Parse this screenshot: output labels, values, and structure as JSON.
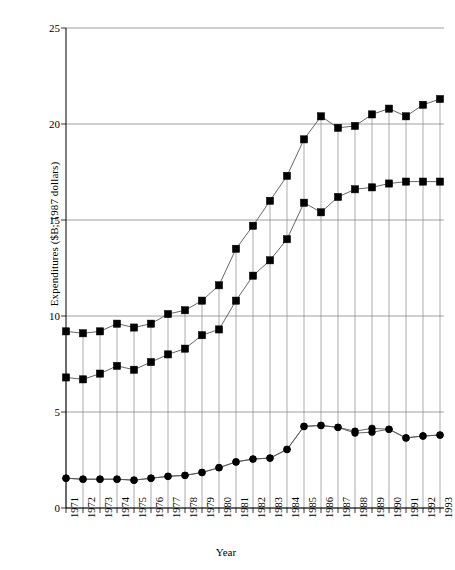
{
  "chart_data": {
    "type": "line",
    "title": "",
    "xlabel": "Year",
    "ylabel": "Expenditures ($B; 1987 dollars)",
    "xlim": [
      1971,
      1993
    ],
    "ylim": [
      0,
      25
    ],
    "yticks": [
      0,
      5,
      10,
      15,
      20,
      25
    ],
    "grid": true,
    "legend": "none",
    "categories": [
      "1971",
      "1972",
      "1973",
      "1974",
      "1975",
      "1976",
      "1977",
      "1978",
      "1979",
      "1980",
      "1981",
      "1982",
      "1983",
      "1984",
      "1985",
      "1986",
      "1987",
      "1988",
      "1989",
      "1990",
      "1991",
      "1992",
      "1993"
    ],
    "series": [
      {
        "name": "Total",
        "marker": "square",
        "color": "#000000",
        "values": [
          9.2,
          9.1,
          9.2,
          9.6,
          9.4,
          9.6,
          10.1,
          10.3,
          10.8,
          11.6,
          13.5,
          14.7,
          16.0,
          17.3,
          19.2,
          20.4,
          19.8,
          19.9,
          20.5,
          20.8,
          20.4,
          21.0,
          21.3
        ]
      },
      {
        "name": "Defense",
        "marker": "square",
        "color": "#000000",
        "values": [
          6.8,
          6.7,
          7.0,
          7.4,
          7.2,
          7.6,
          8.0,
          8.3,
          9.0,
          9.3,
          10.8,
          12.1,
          12.9,
          14.0,
          15.9,
          15.4,
          16.2,
          16.6,
          16.7,
          16.9,
          17.0,
          17.0,
          17.0
        ]
      },
      {
        "name": "Nondefense A",
        "marker": "circle",
        "color": "#000000",
        "values": [
          1.55,
          1.5,
          1.5,
          1.5,
          1.45,
          1.55,
          1.65,
          1.7,
          1.85,
          2.1,
          2.4,
          2.55,
          2.6,
          3.05,
          4.25,
          4.3,
          4.2,
          4.0,
          4.15,
          4.1,
          3.65,
          3.75,
          3.8
        ]
      },
      {
        "name": "Nondefense B",
        "marker": "circle",
        "color": "#000000",
        "values": [
          1.55,
          1.5,
          1.5,
          1.5,
          1.45,
          1.55,
          1.65,
          1.7,
          1.85,
          2.1,
          2.4,
          2.55,
          2.6,
          3.05,
          4.25,
          4.3,
          4.2,
          3.9,
          3.95,
          4.1,
          3.65,
          3.75,
          3.8
        ]
      }
    ]
  },
  "axes": {
    "ytick_labels": [
      "25",
      "20",
      "15",
      "10",
      "5",
      "0"
    ],
    "xtick_labels": [
      "1971",
      "1972",
      "1973",
      "1974",
      "1975",
      "1976",
      "1977",
      "1978",
      "1979",
      "1980",
      "1981",
      "1982",
      "1983",
      "1984",
      "1985",
      "1986",
      "1987",
      "1988",
      "1989",
      "1990",
      "1991",
      "1992",
      "1993"
    ]
  }
}
